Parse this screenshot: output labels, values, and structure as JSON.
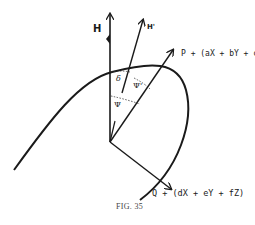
{
  "figure": {
    "caption": "FIG. 35",
    "colors": {
      "ink": "#1a1a1a",
      "background": "#ffffff",
      "caption": "#444444"
    },
    "vectors": {
      "H": {
        "label": "H"
      },
      "H_prime": {
        "label": "H'"
      },
      "P": {
        "label": "P + (aX + bY + cZ)"
      },
      "Q": {
        "label": "Q + (dX + eY + fZ)"
      }
    },
    "angles": {
      "delta": "δ",
      "psi_prime": "Ψ'",
      "psi": "Ψ"
    }
  }
}
